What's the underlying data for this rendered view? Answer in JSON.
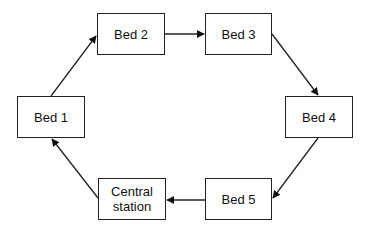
{
  "diagram": {
    "type": "cycle",
    "nodes": [
      {
        "id": "bed1",
        "label": "Bed 1",
        "x": 17,
        "y": 96,
        "w": 68,
        "h": 42
      },
      {
        "id": "bed2",
        "label": "Bed 2",
        "x": 97,
        "y": 13,
        "w": 68,
        "h": 42
      },
      {
        "id": "bed3",
        "label": "Bed 3",
        "x": 205,
        "y": 13,
        "w": 67,
        "h": 42
      },
      {
        "id": "bed4",
        "label": "Bed 4",
        "x": 285,
        "y": 96,
        "w": 68,
        "h": 42
      },
      {
        "id": "bed5",
        "label": "Bed 5",
        "x": 205,
        "y": 178,
        "w": 67,
        "h": 42
      },
      {
        "id": "central",
        "label": "Central\nstation",
        "x": 98,
        "y": 178,
        "w": 68,
        "h": 42
      }
    ],
    "edges": [
      {
        "from": "bed1",
        "to": "bed2"
      },
      {
        "from": "bed2",
        "to": "bed3"
      },
      {
        "from": "bed3",
        "to": "bed4"
      },
      {
        "from": "bed4",
        "to": "bed5"
      },
      {
        "from": "bed5",
        "to": "central"
      },
      {
        "from": "central",
        "to": "bed1"
      }
    ],
    "colors": {
      "stroke": "#222222",
      "fill": "#ffffff",
      "text": "#111111"
    }
  }
}
